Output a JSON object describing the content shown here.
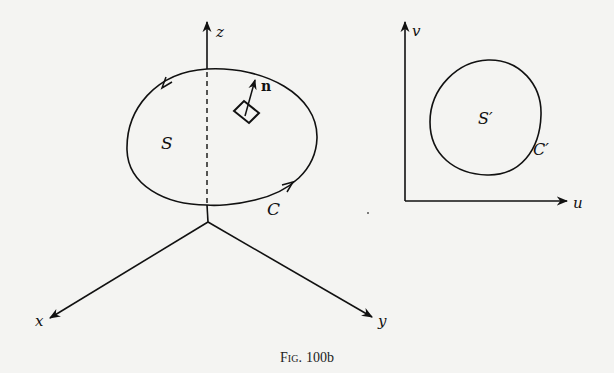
{
  "figure": {
    "caption_prefix": "Fig.",
    "caption_number": "100b",
    "colors": {
      "background": "#f4f4f2",
      "ink": "#111111"
    }
  },
  "left_diagram": {
    "description": "Surface S in xyz-space bounded by curve C with unit normal n",
    "axes": {
      "z": "z",
      "x": "x",
      "y": "y"
    },
    "surface_label": "S",
    "curve_label": "C",
    "normal_label": "n"
  },
  "right_diagram": {
    "description": "Region S' in uv-plane bounded by curve C'",
    "axes": {
      "u": "u",
      "v": "v"
    },
    "region_label": "S′",
    "curve_label": "C′"
  }
}
